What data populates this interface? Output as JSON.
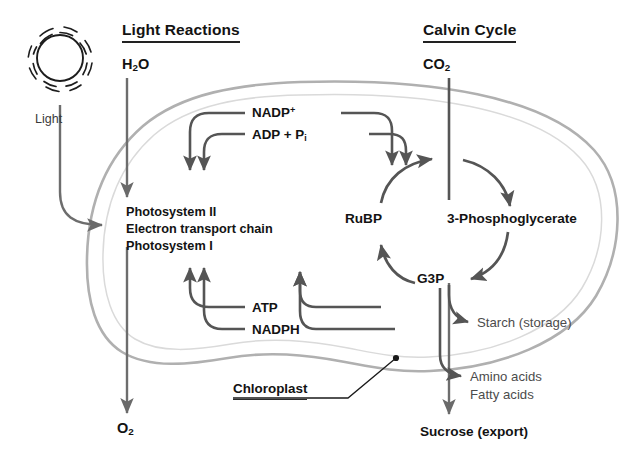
{
  "figure": {
    "title_left": "Light Reactions",
    "title_right": "Calvin Cycle",
    "organelle_label": "Chloroplast",
    "light_label": "Light",
    "sun_icon": "sun-icon"
  },
  "inputs": {
    "water": {
      "formula": "H",
      "sub": "2",
      "tail": "O"
    },
    "carbon_dioxide": {
      "formula": "CO",
      "sub": "2",
      "tail": ""
    }
  },
  "outputs": {
    "oxygen": {
      "formula": "O",
      "sub": "2",
      "tail": ""
    },
    "sucrose": "Sucrose (export)"
  },
  "light_reactions": {
    "complexes": [
      "Photosystem II",
      "Electron transport chain",
      "Photosystem I"
    ],
    "inputs_recycled": [
      {
        "base": "NADP",
        "sup": "+",
        "sub": ""
      },
      {
        "base": "ADP + P",
        "sup": "",
        "sub": "i"
      }
    ],
    "outputs_energy": [
      {
        "base": "ATP",
        "sup": "",
        "sub": ""
      },
      {
        "base": "NADPH",
        "sup": "",
        "sub": ""
      }
    ]
  },
  "calvin_cycle": {
    "nodes": [
      {
        "id": "rubp",
        "label": "RuBP"
      },
      {
        "id": "pga",
        "label": "3-Phosphoglycerate"
      },
      {
        "id": "g3p",
        "label": "G3P"
      }
    ],
    "products": [
      "Starch (storage)",
      "Amino acids",
      "Fatty acids"
    ]
  },
  "colors": {
    "arrow": "#555555",
    "membrane_outer": "#b4b4b4",
    "membrane_inner": "#d8d8d8",
    "text": "#131313",
    "text_light": "#4c4c4c",
    "background": "#ffffff"
  }
}
